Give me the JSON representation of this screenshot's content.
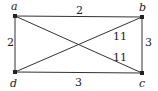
{
  "graph": {
    "vertices": [
      {
        "id": "a",
        "label": "a",
        "x": 15,
        "y": 16,
        "lx": 11,
        "ly": 10
      },
      {
        "id": "b",
        "label": "b",
        "x": 142,
        "y": 17,
        "lx": 139,
        "ly": 11
      },
      {
        "id": "c",
        "label": "c",
        "x": 142,
        "y": 73,
        "lx": 139,
        "ly": 87
      },
      {
        "id": "d",
        "label": "d",
        "x": 15,
        "y": 72,
        "lx": 10,
        "ly": 87
      }
    ],
    "edges": [
      {
        "from": "a",
        "to": "b",
        "weight": "2",
        "wx": 76,
        "wy": 14
      },
      {
        "from": "a",
        "to": "d",
        "weight": "2",
        "wx": 7,
        "wy": 46
      },
      {
        "from": "b",
        "to": "c",
        "weight": "3",
        "wx": 145,
        "wy": 46
      },
      {
        "from": "d",
        "to": "c",
        "weight": "3",
        "wx": 75,
        "wy": 86
      },
      {
        "from": "b",
        "to": "d",
        "weight": "11",
        "wx": 113,
        "wy": 40
      },
      {
        "from": "a",
        "to": "c",
        "weight": "11",
        "wx": 113,
        "wy": 61
      }
    ]
  },
  "colors": {
    "line": "#333333",
    "vertex": "#222222",
    "background": "#ffffff"
  }
}
